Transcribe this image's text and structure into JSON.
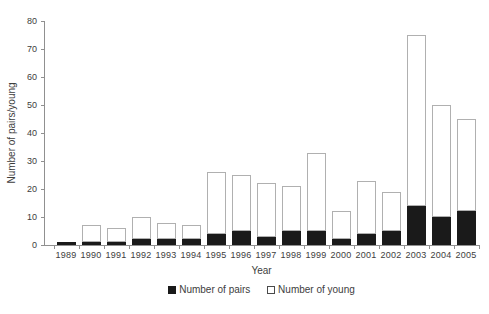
{
  "chart_data": {
    "type": "bar",
    "stacked": true,
    "title": "",
    "xlabel": "Year",
    "ylabel": "Number of pairs/young",
    "ylim": [
      0,
      80
    ],
    "yticks": [
      0,
      10,
      20,
      30,
      40,
      50,
      60,
      70,
      80
    ],
    "grid": false,
    "legend_position": "bottom",
    "categories": [
      "1989",
      "1990",
      "1991",
      "1992",
      "1993",
      "1994",
      "1995",
      "1996",
      "1997",
      "1998",
      "1999",
      "2000",
      "2001",
      "2002",
      "2003",
      "2004",
      "2005"
    ],
    "series": [
      {
        "name": "Number of pairs",
        "color": "#1a1a1a",
        "values": [
          1,
          1,
          1,
          2,
          2,
          2,
          4,
          5,
          3,
          5,
          5,
          2,
          4,
          5,
          14,
          10,
          12
        ]
      },
      {
        "name": "Number of young",
        "color": "#ffffff",
        "border_color": "#b0b0b0",
        "values": [
          0,
          6,
          5,
          8,
          6,
          5,
          22,
          20,
          19,
          16,
          28,
          10,
          19,
          14,
          61,
          40,
          33
        ]
      }
    ],
    "stack_totals": [
      1,
      7,
      6,
      10,
      8,
      7,
      26,
      25,
      22,
      21,
      33,
      12,
      23,
      19,
      75,
      50,
      45
    ]
  },
  "colors": {
    "axis": "#909090",
    "text": "#3d3d3d",
    "background": "#ffffff"
  }
}
